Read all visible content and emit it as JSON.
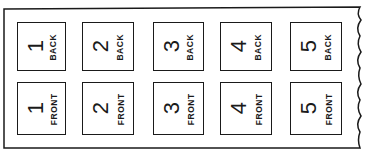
{
  "diagram": {
    "rows": [
      {
        "side": "BACK",
        "cells": [
          {
            "number": "1",
            "label": "BACK"
          },
          {
            "number": "2",
            "label": "BACK"
          },
          {
            "number": "3",
            "label": "BACK"
          },
          {
            "number": "4",
            "label": "BACK"
          },
          {
            "number": "5",
            "label": "BACK"
          }
        ]
      },
      {
        "side": "FRONT",
        "cells": [
          {
            "number": "1",
            "label": "FRONT"
          },
          {
            "number": "2",
            "label": "FRONT"
          },
          {
            "number": "3",
            "label": "FRONT"
          },
          {
            "number": "4",
            "label": "FRONT"
          },
          {
            "number": "5",
            "label": "FRONT"
          }
        ]
      }
    ],
    "colors": {
      "ink": "#1a1a1a",
      "paper": "#ffffff"
    }
  }
}
